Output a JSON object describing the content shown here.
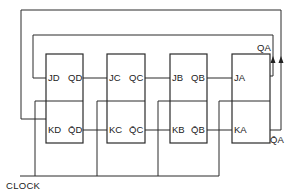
{
  "diagram": {
    "type": "JK flip-flop ring / Johnson counter schematic",
    "clock_label": "CLOCK",
    "flip_flops": [
      {
        "id": "D",
        "j_label": "JD",
        "k_label": "KD",
        "q_label": "QD",
        "qbar_label": "Q̄D"
      },
      {
        "id": "C",
        "j_label": "JC",
        "k_label": "KC",
        "q_label": "QC",
        "qbar_label": "Q̄C"
      },
      {
        "id": "B",
        "j_label": "JB",
        "k_label": "KB",
        "q_label": "QB",
        "qbar_label": "Q̄B"
      },
      {
        "id": "A",
        "j_label": "JA",
        "k_label": "KA",
        "q_label": "",
        "qbar_label": ""
      }
    ],
    "outputs": {
      "qa_label": "QA",
      "qabar_label": "Q̄A"
    },
    "colors": {
      "line": "#2a2a2a",
      "background": "#ffffff"
    }
  }
}
